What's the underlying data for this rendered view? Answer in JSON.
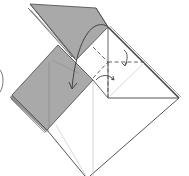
{
  "diagram": {
    "type": "origami-fold-step",
    "colors": {
      "paper_colored": "#a9a9a9",
      "paper_colored_dark": "#8f8f8f",
      "paper_white": "#ffffff",
      "outline": "#555555",
      "crease_light": "#c8c8c8",
      "arrow": "#444444"
    },
    "elements": [
      {
        "name": "top-flap",
        "fill": "colored"
      },
      {
        "name": "left-rectangle-flap",
        "fill": "colored"
      },
      {
        "name": "right-white-square",
        "fill": "white"
      },
      {
        "name": "bottom-white-triangle",
        "fill": "white"
      },
      {
        "name": "valley-fold-dashed-horizontal",
        "style": "dashed"
      },
      {
        "name": "valley-fold-dashed-vertical",
        "style": "dashed"
      },
      {
        "name": "valley-fold-dashed-diagonal",
        "style": "dashed"
      },
      {
        "name": "fold-arrow-large-curved",
        "direction": "down-left"
      },
      {
        "name": "fold-arrow-small-upper",
        "direction": "down"
      },
      {
        "name": "fold-arrow-small-lower",
        "direction": "right"
      },
      {
        "name": "partial-step-bracket",
        "note": "partially visible curve at left edge"
      }
    ]
  }
}
